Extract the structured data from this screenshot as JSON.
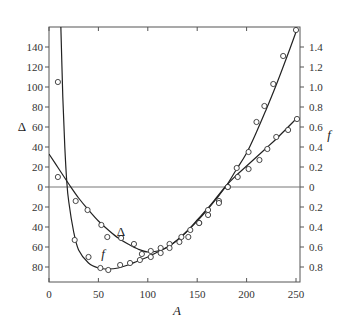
{
  "chart_data": {
    "type": "scatter",
    "title": "",
    "xlabel": "A",
    "ylabel": "Δ",
    "y2label": "f",
    "xlim": [
      0,
      252
    ],
    "ylim": [
      -96,
      162
    ],
    "y2lim": [
      -0.96,
      1.62
    ],
    "grid": false,
    "legend": "none (curves labelled inline)",
    "x_ticks": [
      0,
      50,
      100,
      150,
      200,
      250
    ],
    "y_ticks_left": [
      {
        "value": 140,
        "label": "140"
      },
      {
        "value": 120,
        "label": "120"
      },
      {
        "value": 100,
        "label": "100"
      },
      {
        "value": 80,
        "label": "80"
      },
      {
        "value": 60,
        "label": "60"
      },
      {
        "value": 40,
        "label": "40"
      },
      {
        "value": 20,
        "label": "20"
      },
      {
        "value": 0,
        "label": "0"
      },
      {
        "value": -20,
        "label": "20"
      },
      {
        "value": -40,
        "label": "40"
      },
      {
        "value": -60,
        "label": "60"
      },
      {
        "value": -80,
        "label": "80"
      }
    ],
    "y_ticks_right": [
      {
        "value": 1.4,
        "label": "1.4"
      },
      {
        "value": 1.2,
        "label": "1.2"
      },
      {
        "value": 1.0,
        "label": "1.0"
      },
      {
        "value": 0.8,
        "label": "0.8"
      },
      {
        "value": 0.6,
        "label": "0.6"
      },
      {
        "value": 0.4,
        "label": "0.4"
      },
      {
        "value": 0.2,
        "label": "0.2"
      },
      {
        "value": 0,
        "label": "0"
      },
      {
        "value": -0.2,
        "label": "0.2"
      },
      {
        "value": -0.4,
        "label": "0.4"
      },
      {
        "value": -0.6,
        "label": "0.6"
      },
      {
        "value": -0.8,
        "label": "0.8"
      }
    ],
    "zero_line": true,
    "series": [
      {
        "name": "Δ",
        "axis": "left",
        "marker": "open-circle",
        "points": [
          [
            9,
            10
          ],
          [
            27,
            -14
          ],
          [
            39,
            -23
          ],
          [
            53,
            -38
          ],
          [
            59,
            -50
          ],
          [
            73,
            -51
          ],
          [
            86,
            -57
          ],
          [
            94,
            -67
          ],
          [
            103,
            -64
          ],
          [
            113,
            -61
          ],
          [
            122,
            -57
          ],
          [
            134,
            -50
          ],
          [
            143,
            -43
          ],
          [
            152,
            -36
          ],
          [
            161,
            -28
          ],
          [
            172,
            -14
          ],
          [
            181,
            0
          ],
          [
            191,
            10
          ],
          [
            202,
            18
          ],
          [
            213,
            27
          ],
          [
            221,
            38
          ],
          [
            230,
            50
          ],
          [
            242,
            57
          ],
          [
            251,
            68
          ]
        ],
        "curve": [
          [
            0,
            33
          ],
          [
            10,
            18
          ],
          [
            20,
            3
          ],
          [
            30,
            -11
          ],
          [
            40,
            -23
          ],
          [
            50,
            -34
          ],
          [
            60,
            -43
          ],
          [
            70,
            -51
          ],
          [
            80,
            -57
          ],
          [
            90,
            -62
          ],
          [
            100,
            -65
          ],
          [
            110,
            -64
          ],
          [
            120,
            -60
          ],
          [
            130,
            -53
          ],
          [
            140,
            -44
          ],
          [
            150,
            -33
          ],
          [
            160,
            -22
          ],
          [
            170,
            -10
          ],
          [
            180,
            2
          ],
          [
            190,
            12
          ],
          [
            200,
            21
          ],
          [
            210,
            30
          ],
          [
            220,
            39
          ],
          [
            230,
            48
          ],
          [
            240,
            58
          ],
          [
            250,
            68
          ]
        ]
      },
      {
        "name": "f",
        "axis": "right",
        "marker": "open-circle",
        "points": [
          [
            9,
            1.05
          ],
          [
            26,
            -0.53
          ],
          [
            40,
            -0.7
          ],
          [
            52,
            -0.81
          ],
          [
            60,
            -0.83
          ],
          [
            72,
            -0.78
          ],
          [
            82,
            -0.76
          ],
          [
            92,
            -0.73
          ],
          [
            103,
            -0.7
          ],
          [
            113,
            -0.66
          ],
          [
            122,
            -0.61
          ],
          [
            132,
            -0.55
          ],
          [
            141,
            -0.5
          ],
          [
            152,
            -0.36
          ],
          [
            161,
            -0.23
          ],
          [
            172,
            -0.16
          ],
          [
            181,
            0.0
          ],
          [
            190,
            0.19
          ],
          [
            202,
            0.35
          ],
          [
            210,
            0.65
          ],
          [
            218,
            0.81
          ],
          [
            227,
            1.03
          ],
          [
            237,
            1.31
          ],
          [
            250,
            1.57
          ]
        ],
        "curve": [
          [
            12,
            1.6
          ],
          [
            14,
            0.9
          ],
          [
            16,
            0.4
          ],
          [
            18,
            0.05
          ],
          [
            20,
            -0.15
          ],
          [
            25,
            -0.45
          ],
          [
            30,
            -0.63
          ],
          [
            40,
            -0.76
          ],
          [
            50,
            -0.81
          ],
          [
            60,
            -0.82
          ],
          [
            70,
            -0.81
          ],
          [
            80,
            -0.78
          ],
          [
            90,
            -0.74
          ],
          [
            100,
            -0.7
          ],
          [
            110,
            -0.65
          ],
          [
            120,
            -0.6
          ],
          [
            130,
            -0.53
          ],
          [
            140,
            -0.44
          ],
          [
            150,
            -0.34
          ],
          [
            160,
            -0.23
          ],
          [
            170,
            -0.11
          ],
          [
            180,
            0.02
          ],
          [
            190,
            0.18
          ],
          [
            200,
            0.34
          ],
          [
            210,
            0.55
          ],
          [
            220,
            0.78
          ],
          [
            230,
            1.02
          ],
          [
            240,
            1.28
          ],
          [
            250,
            1.55
          ]
        ]
      }
    ],
    "annotations": [
      {
        "text": "Δ",
        "x": 115,
        "y": -43,
        "axis": "left"
      },
      {
        "text": "f",
        "x": 58,
        "y": -0.66,
        "axis": "right"
      }
    ]
  },
  "labels": {
    "x_axis_title": "A",
    "left_axis_title": "Δ",
    "right_axis_title": "f",
    "delta_curve_label": "Δ",
    "f_curve_label": "f"
  }
}
